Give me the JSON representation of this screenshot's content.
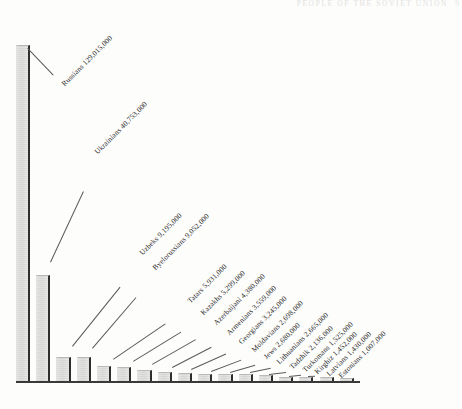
{
  "page": {
    "running_head": "PEOPLE OF THE SOVIET UNION",
    "folio": "9"
  },
  "chart_data": {
    "type": "bar",
    "title": "",
    "subtitle": "",
    "xlabel": "",
    "ylabel": "",
    "grid": false,
    "legend": "none",
    "axis_visible": "baseline-only",
    "ylim": [
      0,
      129015000
    ],
    "categories": [
      "Russians",
      "Ukrainians",
      "Uzbeks",
      "Byelorussians",
      "Tatars",
      "Kazakhs",
      "Azerbaijani",
      "Armenians",
      "Georgians",
      "Moldavians",
      "Jews",
      "Lithuanians",
      "Tadzhik",
      "Turkomans",
      "Kirghiz",
      "Latvians",
      "Estonians"
    ],
    "values": [
      129015000,
      40753000,
      9195000,
      9052000,
      5931000,
      5299000,
      4380000,
      3559000,
      3245000,
      2698000,
      2680000,
      2665000,
      2136000,
      1525000,
      1452000,
      1430000,
      1007000
    ],
    "value_labels": [
      "129,015,000",
      "40,753,000",
      "9,195,000",
      "9,052,000",
      "5,931,000",
      "5,299,000",
      "4,380,000",
      "3,559,000",
      "3,245,000",
      "2,698,000",
      "2,680,000",
      "2,665,000",
      "2,136,000",
      "1,525,000",
      "1,452,000",
      "1,430,000",
      "1,007,000"
    ],
    "annotations": [
      "Russians 129,015,000",
      "Ukrainians 40,753,000",
      "Uzbeks 9,195,000",
      "Byelorussians 9,052,000",
      "Tatars 5,931,000",
      "Kazakhs 5,299,000",
      "Azerbaijani 4,380,000",
      "Armenians 3,559,000",
      "Georgians 3,245,000",
      "Moldavians 2,698,000",
      "Jews 2,680,000",
      "Lithuanians 2,665,000",
      "Tadzhik 2,136,000",
      "Turkomans 1,525,000",
      "Kirghiz 1,452,000",
      "Latvians 1,430,000",
      "Estonians 1,007,000"
    ],
    "colors": {
      "bar_fill": "#e2e2e0",
      "bar_edge": "#2e2e2e",
      "axis": "#3a3a3a",
      "text": "#242424",
      "background": "#fdfdfc"
    }
  }
}
